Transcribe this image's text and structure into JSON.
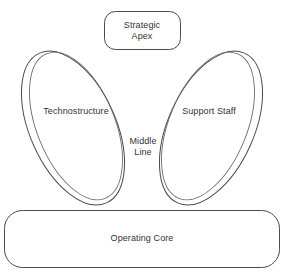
{
  "diagram": {
    "type": "mintzberg-organizational-configuration",
    "background_color": "#ffffff",
    "stroke_color": "#4a4a4a",
    "text_color": "#333333",
    "nodes": {
      "strategic_apex": {
        "label": "Strategic\nApex",
        "shape": "rounded-rectangle",
        "position": "top-center"
      },
      "technostructure": {
        "label": "Technostructure",
        "shape": "tilted-ellipse",
        "position": "left"
      },
      "support_staff": {
        "label": "Support Staff",
        "shape": "tilted-ellipse",
        "position": "right"
      },
      "middle_line": {
        "label": "Middle\nLine",
        "shape": "none",
        "position": "center"
      },
      "operating_core": {
        "label": "Operating Core",
        "shape": "rounded-rectangle",
        "position": "bottom"
      }
    }
  }
}
